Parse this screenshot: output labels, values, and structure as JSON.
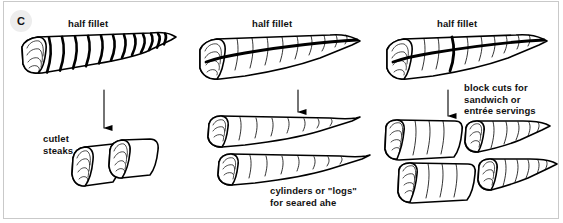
{
  "figure": {
    "panel_label": "C",
    "width": 563,
    "height": 223,
    "background_color": "#ffffff",
    "border_color": "#c9c9c9",
    "line_color": "#000000",
    "badge_color": "#ededed"
  },
  "columns": [
    {
      "id": "cutlet-steaks",
      "source_label": "half fillet",
      "result_label": "cutlet\nsteaks",
      "arrow": "down-arrow",
      "cut_style": "crosswise-slices",
      "piece_count": 2
    },
    {
      "id": "cylinders-logs",
      "source_label": "half fillet",
      "result_label": "cylinders or \"logs\"\nfor seared ahe",
      "arrow": "down-arrow",
      "cut_style": "lengthwise-split",
      "piece_count": 2
    },
    {
      "id": "block-cuts",
      "source_label": "half fillet",
      "result_label": "block cuts for\nsandwich or\nentrée servings",
      "arrow": "down-arrow",
      "cut_style": "lengthwise-and-crosswise",
      "piece_count": 4
    }
  ]
}
